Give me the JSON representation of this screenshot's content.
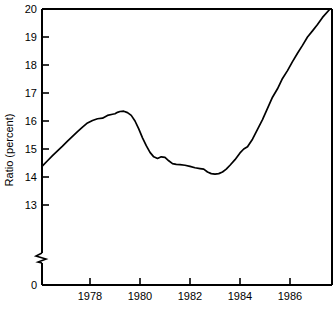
{
  "chart_data": {
    "type": "line",
    "title": "",
    "xlabel": "",
    "ylabel": "Ratio (percent)",
    "xlim": [
      1976.1,
      1987.6
    ],
    "ylim": [
      13.0,
      20.0
    ],
    "yaxis_break": true,
    "yaxis_break_note": "axis broken between 0 and 13",
    "grid": false,
    "legend": false,
    "y_ticks": [
      0,
      13,
      14,
      15,
      16,
      17,
      18,
      19,
      20
    ],
    "y_tick_labels": [
      "0",
      "13",
      "14",
      "15",
      "16",
      "17",
      "18",
      "19",
      "20"
    ],
    "x_ticks": [
      1978,
      1980,
      1982,
      1984,
      1986
    ],
    "x_tick_labels": [
      "1978",
      "1980",
      "1982",
      "1984",
      "1986"
    ],
    "series": [
      {
        "name": "Ratio (percent)",
        "color": "#000000",
        "x": [
          1976.1,
          1976.3,
          1976.5,
          1976.7,
          1976.9,
          1977.1,
          1977.3,
          1977.5,
          1977.7,
          1977.9,
          1978.1,
          1978.3,
          1978.5,
          1978.7,
          1978.9,
          1979.0,
          1979.1,
          1979.2,
          1979.35,
          1979.5,
          1979.65,
          1979.8,
          1979.95,
          1980.1,
          1980.25,
          1980.4,
          1980.55,
          1980.7,
          1980.85,
          1981.0,
          1981.15,
          1981.3,
          1981.45,
          1981.6,
          1981.8,
          1982.0,
          1982.2,
          1982.4,
          1982.55,
          1982.7,
          1982.85,
          1983.0,
          1983.15,
          1983.3,
          1983.45,
          1983.6,
          1983.8,
          1984.0,
          1984.15,
          1984.3,
          1984.5,
          1984.7,
          1984.9,
          1985.1,
          1985.3,
          1985.5,
          1985.7,
          1985.9,
          1986.1,
          1986.3,
          1986.5,
          1986.7,
          1986.9,
          1987.1,
          1987.3,
          1987.6
        ],
        "y": [
          14.4,
          14.58,
          14.76,
          14.93,
          15.1,
          15.28,
          15.45,
          15.62,
          15.78,
          15.93,
          16.02,
          16.08,
          16.1,
          16.2,
          16.24,
          16.26,
          16.31,
          16.34,
          16.35,
          16.3,
          16.2,
          16.0,
          15.72,
          15.4,
          15.12,
          14.88,
          14.72,
          14.66,
          14.72,
          14.7,
          14.58,
          14.48,
          14.45,
          14.44,
          14.42,
          14.38,
          14.33,
          14.3,
          14.28,
          14.18,
          14.12,
          14.1,
          14.12,
          14.18,
          14.28,
          14.42,
          14.62,
          14.86,
          15.0,
          15.08,
          15.35,
          15.7,
          16.05,
          16.45,
          16.85,
          17.15,
          17.52,
          17.8,
          18.12,
          18.42,
          18.7,
          19.0,
          19.22,
          19.45,
          19.7,
          20.0
        ]
      }
    ]
  },
  "axis": {
    "ylabel": "Ratio (percent)",
    "zero_label": "0",
    "y_tick_labels": [
      "20",
      "19",
      "18",
      "17",
      "16",
      "15",
      "14",
      "13"
    ],
    "x_tick_labels": [
      "1978",
      "1980",
      "1982",
      "1984",
      "1986"
    ]
  }
}
